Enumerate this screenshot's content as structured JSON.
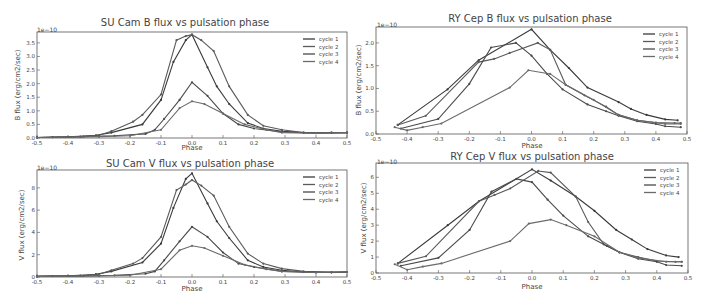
{
  "chart_data": [
    {
      "id": "sucam-b",
      "type": "line",
      "title": "SU Cam   B flux vs pulsation phase",
      "xlabel": "Phase",
      "ylabel": "B flux (erg/cm2/sec)",
      "y_multiplier_label": "1e−10",
      "xlim": [
        -0.5,
        0.5
      ],
      "ylim": [
        0.0,
        3.9
      ],
      "xticks": [
        "-0.5",
        "-0.4",
        "-0.3",
        "-0.2",
        "-0.1",
        "0.0",
        "0.1",
        "0.2",
        "0.3",
        "0.4",
        "0.5"
      ],
      "yticks": [
        "0.0",
        "0.5",
        "1.0",
        "1.5",
        "2.0",
        "2.5",
        "3.0",
        "3.5"
      ],
      "ytick_values": [
        0,
        0.5,
        1.0,
        1.5,
        2.0,
        2.5,
        3.0,
        3.5
      ],
      "legend": [
        "cycle 1",
        "cycle 2",
        "cycle 3",
        "cycle 4"
      ],
      "legend_position": "upper right",
      "series": [
        {
          "name": "cycle 1",
          "x": [
            -0.5,
            -0.45,
            -0.36,
            -0.31,
            -0.26,
            -0.16,
            -0.1,
            -0.06,
            -0.02,
            0.0,
            0.05,
            0.08,
            0.12,
            0.18,
            0.23,
            0.29,
            0.36,
            0.45,
            0.5
          ],
          "y": [
            0.02,
            0.03,
            0.05,
            0.1,
            0.2,
            0.5,
            1.4,
            2.8,
            3.6,
            3.8,
            2.6,
            1.9,
            1.25,
            0.55,
            0.35,
            0.25,
            0.2,
            0.2,
            0.2
          ]
        },
        {
          "name": "cycle 2",
          "x": [
            -0.5,
            -0.4,
            -0.3,
            -0.26,
            -0.19,
            -0.16,
            -0.1,
            -0.05,
            -0.02,
            0.0,
            0.03,
            0.07,
            0.12,
            0.18,
            0.23,
            0.29,
            0.36,
            0.45,
            0.5
          ],
          "y": [
            0.02,
            0.04,
            0.1,
            0.25,
            0.6,
            0.85,
            1.6,
            3.6,
            3.75,
            3.8,
            3.6,
            3.2,
            1.9,
            0.85,
            0.45,
            0.3,
            0.2,
            0.2,
            0.2
          ]
        },
        {
          "name": "cycle 3",
          "x": [
            -0.5,
            -0.35,
            -0.25,
            -0.15,
            -0.12,
            -0.09,
            -0.04,
            0.0,
            0.05,
            0.1,
            0.15,
            0.2,
            0.29,
            0.4,
            0.5
          ],
          "y": [
            0.02,
            0.05,
            0.08,
            0.15,
            0.3,
            0.7,
            1.4,
            2.05,
            1.55,
            0.9,
            0.5,
            0.35,
            0.22,
            0.18,
            0.2
          ]
        },
        {
          "name": "cycle 4",
          "x": [
            -0.5,
            -0.3,
            -0.2,
            -0.1,
            -0.04,
            0.0,
            0.04,
            0.1,
            0.17,
            0.24,
            0.29,
            0.4,
            0.5
          ],
          "y": [
            0.02,
            0.05,
            0.08,
            0.3,
            1.1,
            1.35,
            1.25,
            0.9,
            0.5,
            0.3,
            0.2,
            0.18,
            0.2
          ]
        }
      ]
    },
    {
      "id": "rycep-b",
      "type": "line",
      "title": "RY Cep   B flux vs pulsation phase",
      "xlabel": "Phase",
      "ylabel": "B flux (erg/cm2/sec)",
      "y_multiplier_label": "1e−10",
      "xlim": [
        -0.5,
        0.5
      ],
      "ylim": [
        0.0,
        2.35
      ],
      "xticks": [
        "-0.5",
        "-0.4",
        "-0.3",
        "-0.2",
        "-0.1",
        "0.0",
        "0.1",
        "0.2",
        "0.3",
        "0.4",
        "0.5"
      ],
      "yticks": [
        "0.0",
        "0.5",
        "1.0",
        "1.5",
        "2.0"
      ],
      "ytick_values": [
        0,
        0.5,
        1.0,
        1.5,
        2.0
      ],
      "legend": [
        "cycle 1",
        "cycle 2",
        "cycle 3",
        "cycle 4"
      ],
      "legend_position": "upper right",
      "series": [
        {
          "name": "cycle 1",
          "x": [
            -0.43,
            -0.27,
            -0.17,
            0.0,
            0.06,
            0.12,
            0.18,
            0.28,
            0.32,
            0.37,
            0.43,
            0.47
          ],
          "y": [
            0.2,
            0.98,
            1.62,
            2.3,
            1.85,
            1.45,
            1.02,
            0.7,
            0.55,
            0.42,
            0.32,
            0.3
          ]
        },
        {
          "name": "cycle 2",
          "x": [
            -0.43,
            -0.34,
            -0.17,
            -0.12,
            -0.07,
            0.02,
            0.06,
            0.11,
            0.17,
            0.24,
            0.28,
            0.34,
            0.4,
            0.46,
            0.48
          ],
          "y": [
            0.2,
            0.4,
            1.58,
            1.65,
            1.78,
            2.0,
            1.85,
            1.08,
            0.85,
            0.6,
            0.42,
            0.3,
            0.25,
            0.24,
            0.24
          ]
        },
        {
          "name": "cycle 3",
          "x": [
            -0.42,
            -0.3,
            -0.2,
            -0.13,
            -0.05,
            0.0,
            0.05,
            0.1,
            0.18,
            0.24,
            0.28,
            0.34,
            0.4,
            0.43,
            0.48
          ],
          "y": [
            0.12,
            0.33,
            1.1,
            1.9,
            2.0,
            1.72,
            1.32,
            0.98,
            0.65,
            0.5,
            0.4,
            0.28,
            0.22,
            0.17,
            0.15
          ]
        },
        {
          "name": "cycle 4",
          "x": [
            -0.44,
            -0.4,
            -0.35,
            -0.29,
            -0.07,
            -0.01,
            0.06,
            0.11,
            0.2,
            0.28,
            0.34,
            0.43,
            0.48
          ],
          "y": [
            0.15,
            0.08,
            0.15,
            0.23,
            1.02,
            1.4,
            1.32,
            1.08,
            0.75,
            0.42,
            0.3,
            0.22,
            0.22
          ]
        }
      ]
    },
    {
      "id": "sucam-v",
      "type": "line",
      "title": "SU Cam   V flux vs pulsation phase",
      "xlabel": "Phase",
      "ylabel": "V flux (erg/cm2/sec)",
      "y_multiplier_label": "1e−10",
      "xlim": [
        -0.5,
        0.5
      ],
      "ylim": [
        0,
        9.6
      ],
      "xticks": [
        "-0.5",
        "-0.4",
        "-0.3",
        "-0.2",
        "-0.1",
        "0.0",
        "0.1",
        "0.2",
        "0.3",
        "0.4",
        "0.5"
      ],
      "yticks": [
        "0",
        "2",
        "4",
        "6",
        "8"
      ],
      "ytick_values": [
        0,
        2,
        4,
        6,
        8
      ],
      "legend": [
        "cycle 1",
        "cycle 2",
        "cycle 3",
        "cycle 4"
      ],
      "legend_position": "upper right",
      "series": [
        {
          "name": "cycle 1",
          "x": [
            -0.5,
            -0.45,
            -0.36,
            -0.31,
            -0.26,
            -0.16,
            -0.1,
            -0.06,
            -0.02,
            0.0,
            0.05,
            0.08,
            0.12,
            0.18,
            0.23,
            0.29,
            0.36,
            0.45,
            0.5
          ],
          "y": [
            0.05,
            0.08,
            0.12,
            0.25,
            0.5,
            1.3,
            3.0,
            6.2,
            8.8,
            9.3,
            6.6,
            5.0,
            3.5,
            1.5,
            0.9,
            0.6,
            0.45,
            0.4,
            0.45
          ]
        },
        {
          "name": "cycle 2",
          "x": [
            -0.5,
            -0.4,
            -0.3,
            -0.26,
            -0.19,
            -0.16,
            -0.1,
            -0.05,
            -0.02,
            0.0,
            0.03,
            0.07,
            0.12,
            0.18,
            0.23,
            0.29,
            0.36,
            0.45,
            0.5
          ],
          "y": [
            0.05,
            0.1,
            0.25,
            0.6,
            1.2,
            1.7,
            3.6,
            7.8,
            8.3,
            8.7,
            8.2,
            7.3,
            4.5,
            2.1,
            1.2,
            0.75,
            0.5,
            0.45,
            0.45
          ]
        },
        {
          "name": "cycle 3",
          "x": [
            -0.5,
            -0.35,
            -0.25,
            -0.15,
            -0.12,
            -0.09,
            -0.04,
            0.0,
            0.05,
            0.1,
            0.15,
            0.2,
            0.29,
            0.4,
            0.5
          ],
          "y": [
            0.05,
            0.1,
            0.15,
            0.3,
            0.5,
            1.5,
            3.2,
            4.5,
            3.6,
            2.2,
            1.2,
            0.9,
            0.5,
            0.4,
            0.45
          ]
        },
        {
          "name": "cycle 4",
          "x": [
            -0.5,
            -0.3,
            -0.2,
            -0.1,
            -0.04,
            0.0,
            0.04,
            0.1,
            0.17,
            0.24,
            0.29,
            0.4,
            0.5
          ],
          "y": [
            0.05,
            0.1,
            0.15,
            0.7,
            2.4,
            2.8,
            2.6,
            1.9,
            1.1,
            0.7,
            0.5,
            0.4,
            0.45
          ]
        }
      ]
    },
    {
      "id": "rycep-v",
      "type": "line",
      "title": "RY Cep   V flux vs pulsation phase",
      "xlabel": "Phase",
      "ylabel": "V flux (erg/cm2/sec)",
      "y_multiplier_label": "1e−10",
      "xlim": [
        -0.5,
        0.5
      ],
      "ylim": [
        0,
        6.9
      ],
      "xticks": [
        "-0.5",
        "-0.4",
        "-0.3",
        "-0.2",
        "-0.1",
        "0.0",
        "0.1",
        "0.2",
        "0.3",
        "0.4",
        "0.5"
      ],
      "yticks": [
        "0",
        "1",
        "2",
        "3",
        "4",
        "5",
        "6"
      ],
      "ytick_values": [
        0,
        1,
        2,
        3,
        4,
        5,
        6
      ],
      "legend": [
        "cycle 1",
        "cycle 2",
        "cycle 3",
        "cycle 4"
      ],
      "legend_position": "upper right",
      "series": [
        {
          "name": "cycle 1",
          "x": [
            -0.43,
            -0.27,
            -0.17,
            0.0,
            0.06,
            0.14,
            0.2,
            0.27,
            0.32,
            0.37,
            0.43,
            0.47
          ],
          "y": [
            0.6,
            3.0,
            4.5,
            6.5,
            5.8,
            4.8,
            3.9,
            2.7,
            2.1,
            1.5,
            1.1,
            1.0
          ]
        },
        {
          "name": "cycle 2",
          "x": [
            -0.43,
            -0.34,
            -0.17,
            -0.12,
            -0.07,
            0.02,
            0.06,
            0.14,
            0.18,
            0.23,
            0.28,
            0.34,
            0.4,
            0.46,
            0.48
          ],
          "y": [
            0.6,
            1.05,
            4.5,
            4.9,
            5.3,
            6.4,
            6.3,
            4.8,
            3.2,
            1.8,
            1.3,
            1.0,
            0.75,
            0.7,
            0.7
          ]
        },
        {
          "name": "cycle 3",
          "x": [
            -0.42,
            -0.3,
            -0.2,
            -0.13,
            -0.05,
            0.0,
            0.05,
            0.1,
            0.18,
            0.24,
            0.28,
            0.34,
            0.4,
            0.43,
            0.48
          ],
          "y": [
            0.45,
            0.95,
            2.7,
            5.1,
            5.9,
            5.7,
            4.6,
            3.6,
            2.3,
            1.7,
            1.3,
            0.9,
            0.7,
            0.5,
            0.45
          ]
        },
        {
          "name": "cycle 4",
          "x": [
            -0.44,
            -0.4,
            -0.35,
            -0.29,
            -0.07,
            -0.01,
            0.06,
            0.11,
            0.2,
            0.28,
            0.34,
            0.43,
            0.48
          ],
          "y": [
            0.55,
            0.2,
            0.4,
            0.6,
            2.0,
            3.1,
            3.35,
            3.0,
            2.3,
            1.3,
            0.95,
            0.7,
            0.7
          ]
        }
      ]
    }
  ],
  "series_colors": [
    "#3a3a3a",
    "#5a5a5a",
    "#4a4a4a",
    "#6a6a6a"
  ],
  "panels": [
    {
      "title": "SU Cam   B flux vs pulsation phase",
      "xlabel": "Phase",
      "ylabel": "B flux (erg/cm2/sec)"
    },
    {
      "title": "RY Cep   B flux vs pulsation phase",
      "xlabel": "Phase",
      "ylabel": "B flux (erg/cm2/sec)"
    },
    {
      "title": "SU Cam   V flux vs pulsation phase",
      "xlabel": "Phase",
      "ylabel": "V flux (erg/cm2/sec)"
    },
    {
      "title": "RY Cep   V flux vs pulsation phase",
      "xlabel": "Phase",
      "ylabel": "V flux (erg/cm2/sec)"
    }
  ]
}
